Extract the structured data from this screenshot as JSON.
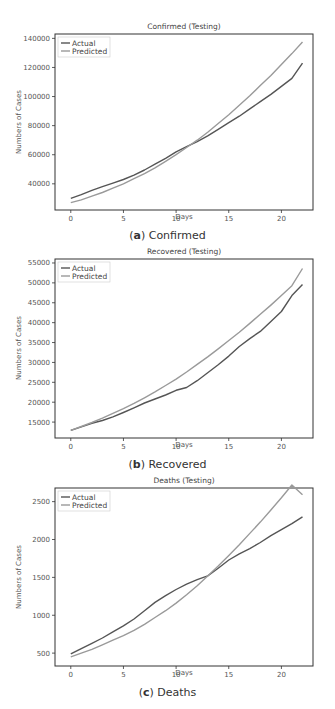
{
  "chart_data": [
    {
      "type": "line",
      "title": "Confirmed (Testing)",
      "caption_letter": "a",
      "caption_text": "Confirmed",
      "xlabel": "Days",
      "ylabel": "Numbers of Cases",
      "xlim": [
        -1.5,
        23
      ],
      "ylim": [
        22000,
        143000
      ],
      "xticks": [
        0,
        5,
        10,
        15,
        20
      ],
      "yticks": [
        40000,
        60000,
        80000,
        100000,
        120000,
        140000
      ],
      "legend": [
        "Actual",
        "Predicted"
      ],
      "legend_position": "upper left",
      "grid": false,
      "x": [
        0,
        1,
        2,
        3,
        4,
        5,
        6,
        7,
        8,
        9,
        10,
        11,
        12,
        13,
        14,
        15,
        16,
        17,
        18,
        19,
        20,
        21,
        22
      ],
      "series": [
        {
          "name": "Actual",
          "color": "#555555",
          "values": [
            30000,
            32500,
            35500,
            38000,
            40500,
            43000,
            46000,
            49500,
            53500,
            57500,
            62000,
            65500,
            69000,
            73000,
            77500,
            82000,
            86500,
            91500,
            96500,
            101500,
            107000,
            112500,
            123000
          ]
        },
        {
          "name": "Predicted",
          "color": "#9a9a9a",
          "values": [
            27000,
            29000,
            31500,
            34000,
            37000,
            40000,
            43500,
            47000,
            51000,
            55500,
            60000,
            65000,
            70000,
            75500,
            81500,
            87500,
            94000,
            100500,
            107500,
            114500,
            122000,
            129500,
            137500
          ]
        }
      ]
    },
    {
      "type": "line",
      "title": "Recovered (Testing)",
      "caption_letter": "b",
      "caption_text": "Recovered",
      "xlabel": "Days",
      "ylabel": "Numbers of Cases",
      "xlim": [
        -1.5,
        23
      ],
      "ylim": [
        11000,
        56000
      ],
      "xticks": [
        0,
        5,
        10,
        15,
        20
      ],
      "yticks": [
        15000,
        20000,
        25000,
        30000,
        35000,
        40000,
        45000,
        50000,
        55000
      ],
      "legend": [
        "Actual",
        "Predicted"
      ],
      "legend_position": "upper left",
      "grid": false,
      "x": [
        0,
        1,
        2,
        3,
        4,
        5,
        6,
        7,
        8,
        9,
        10,
        11,
        12,
        13,
        14,
        15,
        16,
        17,
        18,
        19,
        20,
        21,
        22
      ],
      "series": [
        {
          "name": "Actual",
          "color": "#555555",
          "values": [
            12900,
            13800,
            14700,
            15400,
            16300,
            17400,
            18600,
            19800,
            20800,
            21800,
            23000,
            23700,
            25400,
            27400,
            29400,
            31600,
            34000,
            36000,
            37800,
            40300,
            42800,
            46800,
            49600
          ]
        },
        {
          "name": "Predicted",
          "color": "#9a9a9a",
          "values": [
            12900,
            13900,
            14900,
            16000,
            17200,
            18400,
            19700,
            21100,
            22600,
            24200,
            25800,
            27600,
            29500,
            31400,
            33400,
            35500,
            37600,
            39800,
            42100,
            44400,
            46800,
            49300,
            53600
          ]
        }
      ]
    },
    {
      "type": "line",
      "title": "Deaths (Testing)",
      "caption_letter": "c",
      "caption_text": "Deaths",
      "xlabel": "Days",
      "ylabel": "Numbers of Cases",
      "xlim": [
        -1.5,
        23
      ],
      "ylim": [
        330,
        2680
      ],
      "xticks": [
        0,
        5,
        10,
        15,
        20
      ],
      "yticks": [
        500,
        1000,
        1500,
        2000,
        2500
      ],
      "legend": [
        "Actual",
        "Predicted"
      ],
      "legend_position": "upper left",
      "grid": false,
      "x": [
        0,
        1,
        2,
        3,
        4,
        5,
        6,
        7,
        8,
        9,
        10,
        11,
        12,
        13,
        14,
        15,
        16,
        17,
        18,
        19,
        20,
        21,
        22
      ],
      "series": [
        {
          "name": "Actual",
          "color": "#555555",
          "values": [
            490,
            560,
            630,
            700,
            780,
            860,
            950,
            1060,
            1170,
            1260,
            1340,
            1410,
            1470,
            1520,
            1620,
            1730,
            1810,
            1880,
            1960,
            2050,
            2130,
            2210,
            2300
          ]
        },
        {
          "name": "Predicted",
          "color": "#9a9a9a",
          "values": [
            450,
            500,
            550,
            610,
            670,
            730,
            800,
            880,
            970,
            1060,
            1160,
            1270,
            1390,
            1520,
            1650,
            1790,
            1930,
            2080,
            2230,
            2390,
            2550,
            2720,
            2590
          ]
        }
      ]
    }
  ]
}
